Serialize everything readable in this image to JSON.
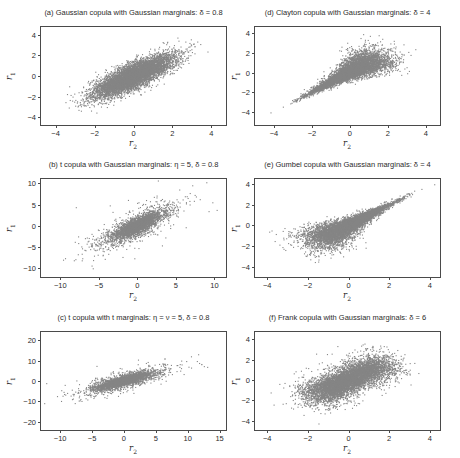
{
  "figure": {
    "background": "#ffffff",
    "point_color": "#858585",
    "axis_color": "#4a4a4a",
    "text_color": "#2b2b2b",
    "layout": "2 columns x 3 rows of scatter panels"
  },
  "chart_data": [
    {
      "panel": "a",
      "type": "scatter",
      "title": "(a) Gaussian copula with Gaussian marginals: δ = 0.8",
      "copula": "Gaussian",
      "marginals": "Gaussian",
      "params": {
        "delta": 0.8
      },
      "xlabel": "r2",
      "ylabel": "r1",
      "xlabel_base": "r",
      "xlabel_sub": "2",
      "ylabel_base": "r",
      "ylabel_sub": "1",
      "xlim": [
        -4.75,
        4.75
      ],
      "ylim": [
        -4.75,
        4.75
      ],
      "xticks": [
        -4,
        -2,
        0,
        2,
        4
      ],
      "yticks": [
        -4,
        -2,
        0,
        2,
        4
      ],
      "n_points": 7000,
      "shape": "dense diagonal ellipse, positive correlation, light tails",
      "sim": {
        "family": "gaussian",
        "rho": 0.8,
        "scale": 1.0,
        "df": 0,
        "delta": 0,
        "flip": false,
        "seed": 11
      }
    },
    {
      "panel": "d",
      "type": "scatter",
      "title": "(d) Clayton copula with Gaussian marginals: δ = 4",
      "copula": "Clayton",
      "marginals": "Gaussian",
      "params": {
        "delta": 4
      },
      "xlabel": "r2",
      "ylabel": "r1",
      "xlabel_base": "r",
      "xlabel_sub": "2",
      "ylabel_base": "r",
      "ylabel_sub": "1",
      "xlim": [
        -5.0,
        4.75
      ],
      "ylim": [
        -5.3,
        4.6
      ],
      "xticks": [
        -4,
        -2,
        0,
        2,
        4
      ],
      "yticks": [
        -4,
        -2,
        0,
        2,
        4
      ],
      "n_points": 7000,
      "shape": "funnel: sharp lower-left tail dependence, wide spread upper-right",
      "sim": {
        "family": "clayton",
        "rho": 0,
        "scale": 1.0,
        "df": 0,
        "delta": 4,
        "flip": false,
        "seed": 22
      }
    },
    {
      "panel": "b",
      "type": "scatter",
      "title": "(b) t copula with Gaussian marginals: η = 5, δ = 0.8",
      "copula": "t",
      "marginals": "Gaussian",
      "params": {
        "eta": 5,
        "delta": 0.8
      },
      "xlabel": "r2",
      "ylabel": "r1",
      "xlabel_base": "r",
      "xlabel_sub": "2",
      "ylabel_base": "r",
      "ylabel_sub": "1",
      "xlim": [
        -12.5,
        11.5
      ],
      "ylim": [
        -12.0,
        11.0
      ],
      "xticks": [
        -10,
        -5,
        0,
        5,
        10
      ],
      "yticks": [
        -10,
        -5,
        0,
        5,
        10
      ],
      "n_points": 3500,
      "shape": "tight diagonal core with heavy-tailed outliers along the diagonal",
      "sim": {
        "family": "t",
        "rho": 0.8,
        "scale": 1.6,
        "df": 5,
        "delta": 0,
        "flip": false,
        "seed": 33
      }
    },
    {
      "panel": "e",
      "type": "scatter",
      "title": "(e) Gumbel copula with Gaussian marginals: δ = 4",
      "copula": "Gumbel",
      "marginals": "Gaussian",
      "params": {
        "delta": 4
      },
      "xlabel": "r2",
      "ylabel": "r1",
      "xlabel_base": "r",
      "xlabel_sub": "2",
      "ylabel_base": "r",
      "ylabel_sub": "1",
      "xlim": [
        -4.6,
        4.5
      ],
      "ylim": [
        -5.0,
        4.5
      ],
      "xticks": [
        -4,
        -2,
        0,
        2,
        4
      ],
      "yticks": [
        -4,
        -2,
        0,
        2,
        4
      ],
      "n_points": 7000,
      "shape": "sharp upper-right tail dependence, wide spread lower-left",
      "sim": {
        "family": "clayton",
        "rho": 0,
        "scale": 1.0,
        "df": 0,
        "delta": 4.5,
        "flip": true,
        "seed": 44
      }
    },
    {
      "panel": "c",
      "type": "scatter",
      "title": "(c) t copula with t marginals: η = ν = 5, δ = 0.8",
      "copula": "t",
      "marginals": "t",
      "params": {
        "eta": 5,
        "nu": 5,
        "delta": 0.8
      },
      "xlabel": "r2",
      "ylabel": "r1",
      "xlabel_base": "r",
      "xlabel_sub": "2",
      "ylabel_base": "r",
      "ylabel_sub": "1",
      "xlim": [
        -13.0,
        16.0
      ],
      "ylim": [
        -24.0,
        24.0
      ],
      "xticks": [
        -10,
        -5,
        0,
        5,
        10,
        15
      ],
      "yticks": [
        -20,
        -10,
        0,
        10,
        20
      ],
      "n_points": 3500,
      "shape": "flat tight diagonal core with scattered heavy-tailed outliers",
      "sim": {
        "family": "t",
        "rho": 0.8,
        "scale": 2.0,
        "df": 5,
        "delta": 0,
        "flip": false,
        "seed": 55
      }
    },
    {
      "panel": "f",
      "type": "scatter",
      "title": "(f) Frank copula with Gaussian marginals: δ = 6",
      "copula": "Frank",
      "marginals": "Gaussian",
      "params": {
        "delta": 6
      },
      "xlabel": "r2",
      "ylabel": "r1",
      "xlabel_base": "r",
      "xlabel_sub": "2",
      "ylabel_base": "r",
      "ylabel_sub": "1",
      "xlim": [
        -4.6,
        4.5
      ],
      "ylim": [
        -4.9,
        4.7
      ],
      "xticks": [
        -4,
        -2,
        0,
        2,
        4
      ],
      "yticks": [
        -4,
        -2,
        0,
        2,
        4
      ],
      "n_points": 7000,
      "shape": "broad rounded blob, moderate positive dependence, no tail dependence",
      "sim": {
        "family": "frank",
        "rho": 0,
        "scale": 1.0,
        "df": 0,
        "delta": 6,
        "flip": false,
        "seed": 66
      }
    }
  ]
}
